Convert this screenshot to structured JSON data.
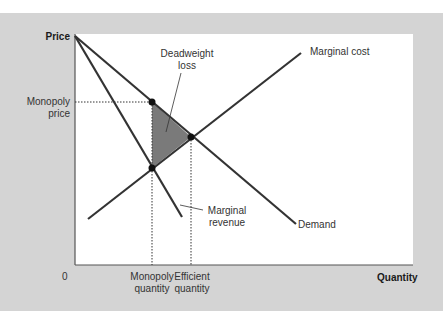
{
  "figure": {
    "y_axis_label": "Price",
    "x_axis_label": "Quantity",
    "origin_label": "0",
    "y_ticks": {
      "monopoly_price": "Monopoly\nprice"
    },
    "x_ticks": {
      "monopoly_quantity": "Monopoly\nquantity",
      "efficient_quantity": "Efficient\nquantity"
    },
    "curves": {
      "marginal_cost": "Marginal cost",
      "demand": "Demand",
      "marginal_revenue": "Marginal\nrevenue"
    },
    "annotations": {
      "deadweight_loss": "Deadweight\nloss"
    },
    "colors": {
      "panel": "#d4d4d4",
      "plot_bg": "#ffffff",
      "lines": "#333333",
      "dwl_fill": "#7a7a7a"
    }
  }
}
